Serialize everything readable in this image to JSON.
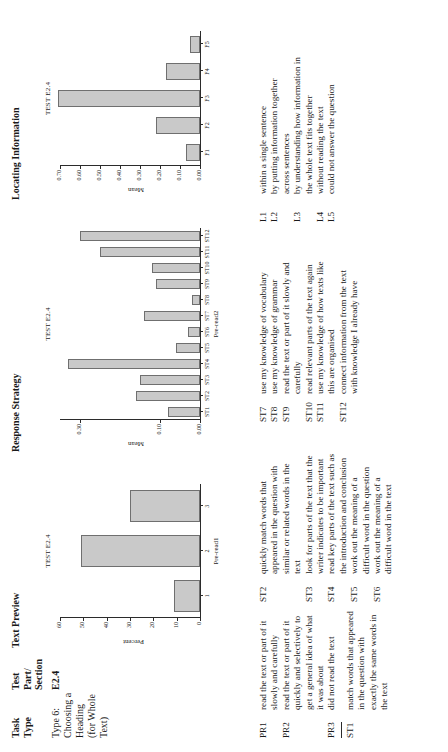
{
  "headers": {
    "task_type": "Task\nType",
    "test_part": "Test\nPart/\nSection",
    "text_preview": "Text Preview",
    "response_strategy": "Response Strategy",
    "locating_information": "Locating Information"
  },
  "row": {
    "task_type": "Type 6: Choosing a Heading (for Whole Text)",
    "test_part": "E2.4"
  },
  "chart_data": [
    {
      "type": "bar",
      "title": "TEST E2.4",
      "categories": [
        "1",
        "2",
        "3"
      ],
      "values": [
        11,
        51,
        30
      ],
      "xlabel": "Pre-read1",
      "ylabel": "Percent",
      "ylim": [
        0,
        60
      ],
      "yticks": [
        0,
        10,
        20,
        30,
        40,
        50,
        60
      ],
      "ytick_labels": [
        "0",
        "10",
        "20",
        "30",
        "40",
        "50",
        "60"
      ],
      "grid": false,
      "legend": "none"
    },
    {
      "type": "bar",
      "title": "TEST E2.4",
      "categories": [
        "ST1",
        "ST2",
        "ST3",
        "ST4",
        "ST5",
        "ST6",
        "ST7",
        "ST8",
        "ST9",
        "ST10",
        "ST11",
        "ST12"
      ],
      "values": [
        0.08,
        0.16,
        0.15,
        0.33,
        0.06,
        0.03,
        0.14,
        0.02,
        0.11,
        0.12,
        0.25,
        0.3
      ],
      "xlabel": "Pre-read2",
      "ylabel": "Mean",
      "ylim": [
        0,
        0.35
      ],
      "yticks": [
        0.0,
        0.1,
        0.3
      ],
      "ytick_labels": [
        "0.00",
        "0.10",
        "0.30"
      ],
      "grid": false,
      "legend": "none"
    },
    {
      "type": "bar",
      "title": "TEST E2.4",
      "categories": [
        "F1",
        "F2",
        "F3",
        "F4",
        "F5"
      ],
      "values": [
        0.07,
        0.22,
        0.71,
        0.17,
        0.05
      ],
      "xlabel": "",
      "ylabel": "Mean",
      "ylim": [
        0,
        0.7
      ],
      "yticks": [
        0.0,
        0.1,
        0.2,
        0.3,
        0.4,
        0.5,
        0.6,
        0.7
      ],
      "ytick_labels": [
        "0.00",
        "0.10",
        "0.20",
        "0.30",
        "0.40",
        "0.50",
        "0.60",
        "0.70"
      ],
      "grid": false,
      "legend": "none"
    }
  ],
  "legend": {
    "pr": [
      {
        "code": "PR1",
        "text": "read the text or part of it slowly and carefully"
      },
      {
        "code": "PR2",
        "text": "read the text or part of it quickly and selectively to get a general idea of what it was about"
      },
      {
        "code": "PR3",
        "text": "did not read the text"
      }
    ],
    "pr_extra": [
      {
        "code": "ST1",
        "text": "match words that appeared in the question with exactly the same words in the text"
      }
    ],
    "st": [
      {
        "code": "ST2",
        "text": "quickly match words that appeared in the question with similar or related words in the text"
      },
      {
        "code": "ST3",
        "text": "look for parts of the text that the writer indicates to be important"
      },
      {
        "code": "ST4",
        "text": "read key parts of the text such as the introduction and conclusion"
      },
      {
        "code": "ST5",
        "text": "work out the meaning of a difficult word in the question"
      },
      {
        "code": "ST6",
        "text": "work out the meaning of a difficult word in the text"
      }
    ],
    "st2": [
      {
        "code": "ST7",
        "text": "use my knowledge of vocabulary"
      },
      {
        "code": "ST8",
        "text": "use my knowledge of grammar"
      },
      {
        "code": "ST9",
        "text": "read the text or part of it slowly and carefully"
      },
      {
        "code": "ST10",
        "text": "read relevant parts of the text again"
      },
      {
        "code": "ST11",
        "text": "use my knowledge of how texts like this are organised"
      },
      {
        "code": "ST12",
        "text": "connect information from the text with knowledge I already have"
      }
    ],
    "l": [
      {
        "code": "L1",
        "text": "within a single sentence"
      },
      {
        "code": "L2",
        "text": "by putting information together across sentences"
      },
      {
        "code": "L3",
        "text": "by understanding how information in the whole text fits together"
      },
      {
        "code": "L4",
        "text": "without reading the text"
      },
      {
        "code": "L5",
        "text": "could not answer the question"
      }
    ]
  },
  "colors": {
    "bar_fill": "#c9c9c9",
    "bar_stroke": "#6f6f6f",
    "axis": "#2b2b2b",
    "text": "#1a1a1a"
  }
}
